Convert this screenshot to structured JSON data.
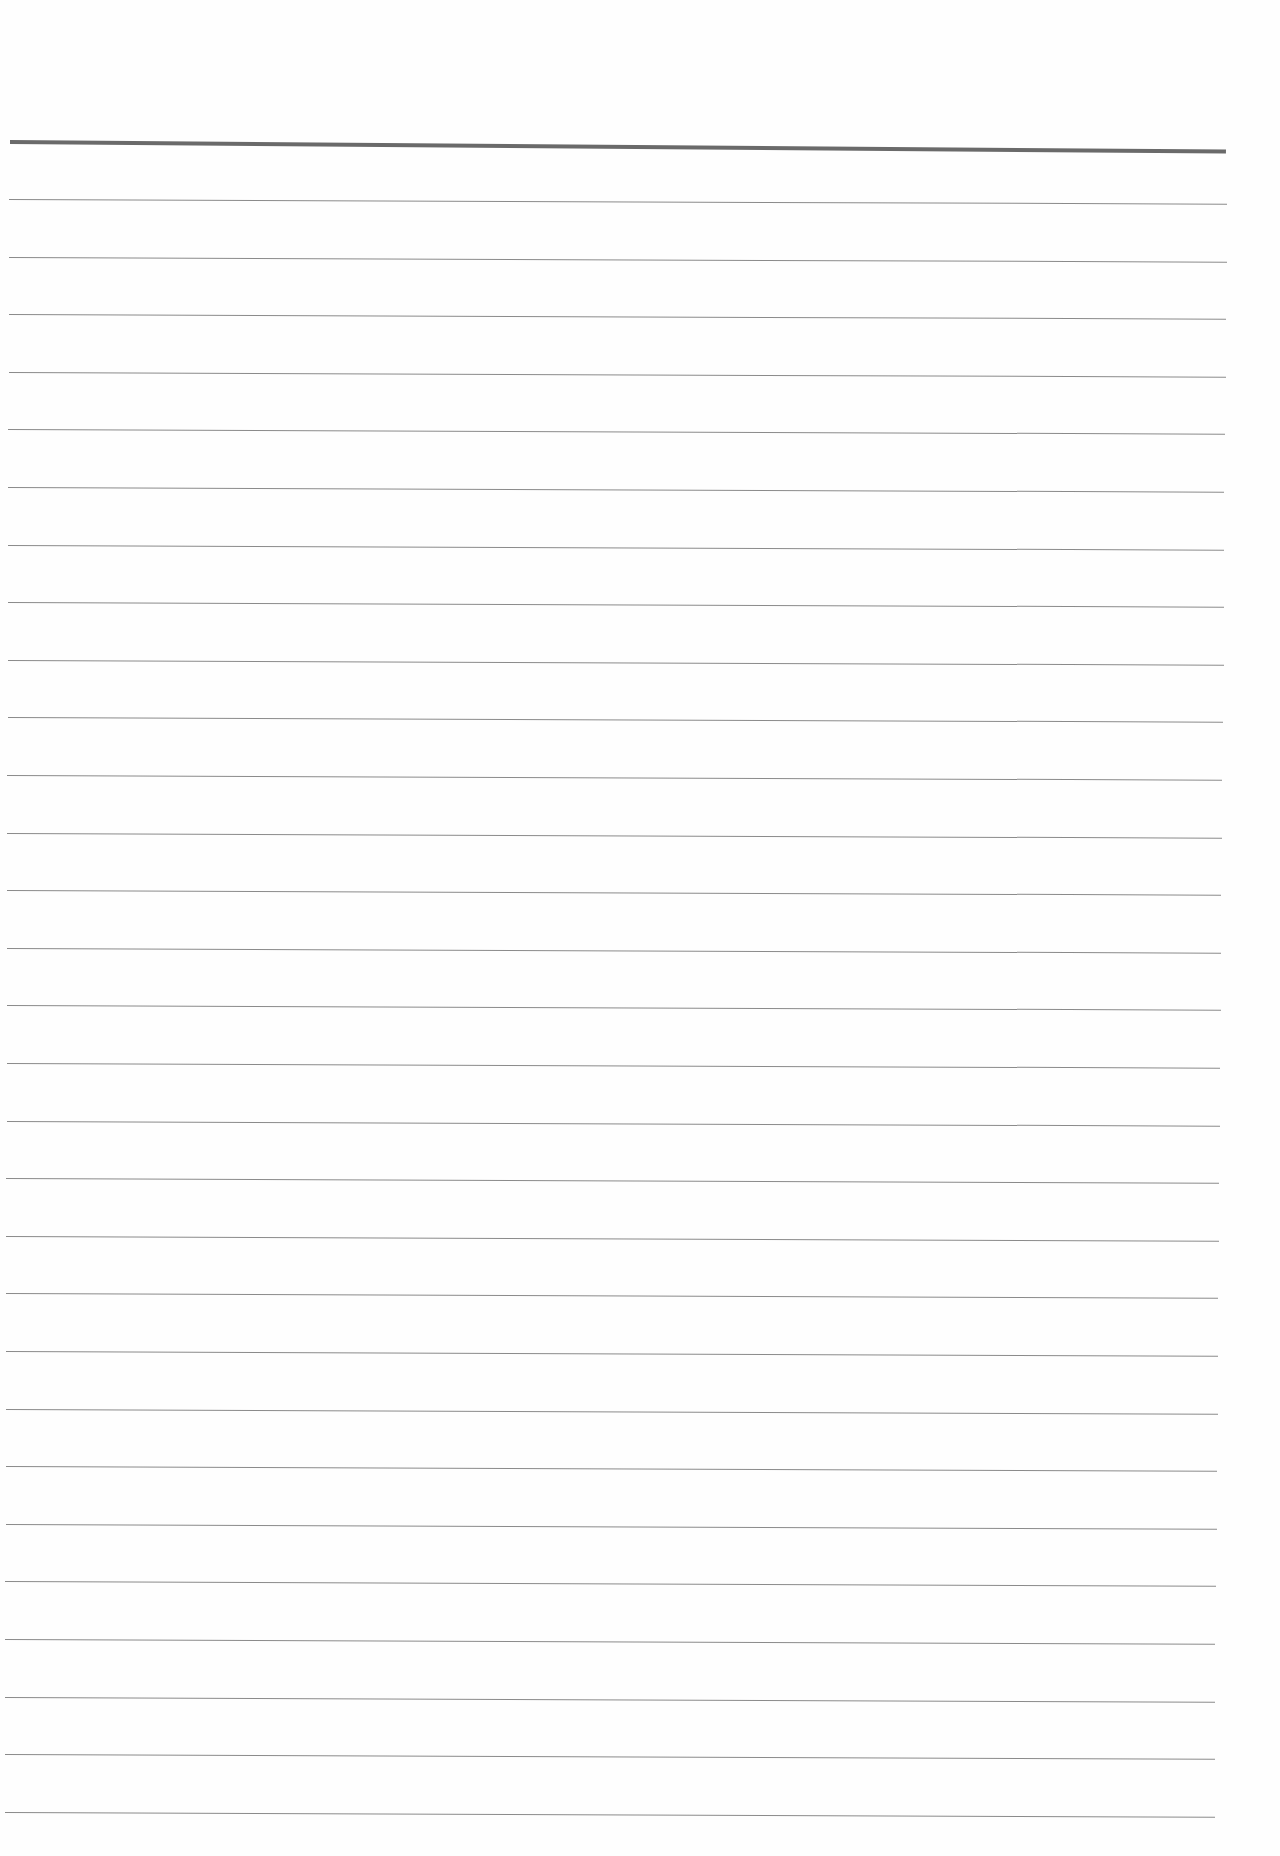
{
  "page": {
    "type": "lined-paper",
    "background_color": "#fefefe",
    "header_rule": {
      "y": 140,
      "thickness": 4,
      "color": "#6a6a6a"
    },
    "rules": {
      "count": 29,
      "first_y": 199,
      "spacing": 57.6,
      "thickness": 1,
      "color": "#8a8a8a"
    }
  }
}
